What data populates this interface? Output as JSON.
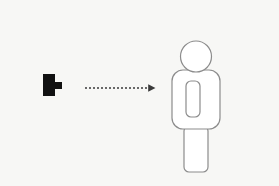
{
  "scene": {
    "title": "Plug connecting to person pictogram",
    "canvas": {
      "width": 279,
      "height": 186
    },
    "background_color": "#f7f7f5",
    "stroke_color": "#888888",
    "fill_color": "#111111",
    "outline_fill": "#ffffff"
  },
  "objects": {
    "plug": {
      "label": "plug-shape",
      "color": "#111111",
      "body": {
        "x": 43,
        "y": 74,
        "width": 12,
        "height": 22
      },
      "tip": {
        "x": 55,
        "y": 82,
        "width": 7,
        "height": 7
      }
    },
    "arrow": {
      "label": "dashed-arrow-right",
      "color": "#3a3a3a",
      "start_x": 85,
      "end_x": 149,
      "tip_x": 158,
      "y": 88,
      "dash_pattern": "2 2",
      "stroke_width": 1.4,
      "head_width": 9,
      "head_height": 9
    },
    "person": {
      "label": "person-pictogram",
      "stroke_color": "#8c8c8c",
      "fill_color": "#ffffff",
      "stroke_width": 1.2,
      "head": {
        "cx": 196,
        "cy": 56.5,
        "r": 15.5
      },
      "torso": {
        "x": 172,
        "y": 70,
        "width": 48,
        "height": 59,
        "radius": 11
      },
      "badge": {
        "x": 186,
        "y": 81,
        "width": 14,
        "height": 36,
        "radius": 5
      },
      "legs": {
        "x": 184,
        "y": 126,
        "width": 24,
        "height": 46,
        "radius": 5
      }
    }
  }
}
